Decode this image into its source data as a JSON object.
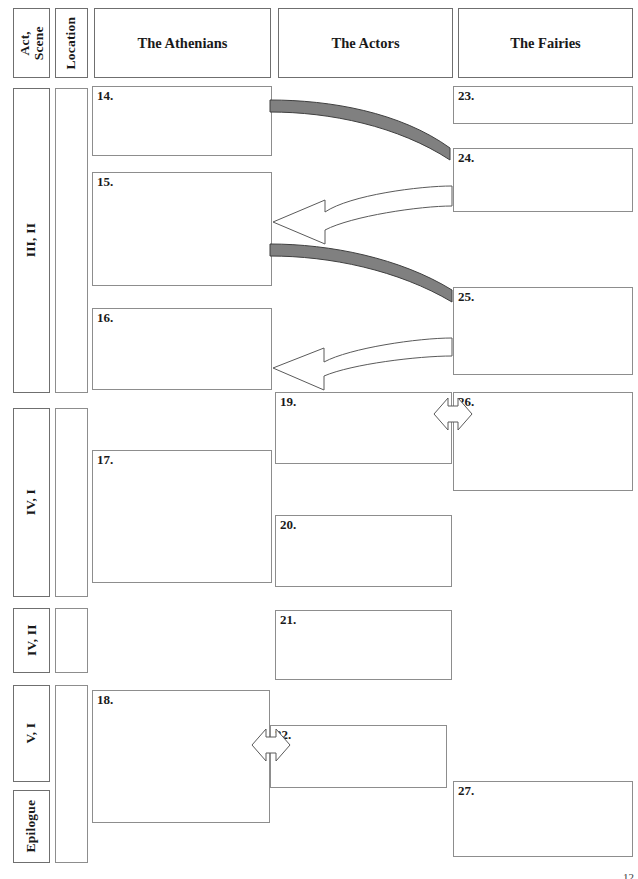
{
  "document": {
    "kind": "worksheet-grid",
    "description": "Blank character-plot tracking chart for A Midsummer Night's Dream, acts III-V plus Epilogue"
  },
  "header": {
    "act_scene_label": "Act,\nScene",
    "location_label": "Location",
    "columns": [
      {
        "id": "athenians",
        "label": "The Athenians"
      },
      {
        "id": "actors",
        "label": "The Actors"
      },
      {
        "id": "fairies",
        "label": "The Fairies"
      }
    ]
  },
  "rows": [
    {
      "id": "row-3-2",
      "act_scene": "III, II"
    },
    {
      "id": "row-4-1",
      "act_scene": "IV, I"
    },
    {
      "id": "row-4-2",
      "act_scene": "IV, II"
    },
    {
      "id": "row-5-1",
      "act_scene": "V, I"
    },
    {
      "id": "row-epilogue",
      "act_scene": "Epilogue"
    }
  ],
  "cells": [
    {
      "id": "cell-14",
      "number": "14.",
      "column": "athenians",
      "row": "row-3-2"
    },
    {
      "id": "cell-15",
      "number": "15.",
      "column": "athenians",
      "row": "row-3-2"
    },
    {
      "id": "cell-16",
      "number": "16.",
      "column": "athenians",
      "row": "row-3-2"
    },
    {
      "id": "cell-17",
      "number": "17.",
      "column": "athenians",
      "row": "row-4-1"
    },
    {
      "id": "cell-18",
      "number": "18.",
      "column": "athenians",
      "row": "row-5-1"
    },
    {
      "id": "cell-19",
      "number": "19.",
      "column": "actors",
      "row": "row-4-1"
    },
    {
      "id": "cell-20",
      "number": "20.",
      "column": "actors",
      "row": "row-4-1"
    },
    {
      "id": "cell-21",
      "number": "21.",
      "column": "actors",
      "row": "row-4-2"
    },
    {
      "id": "cell-22",
      "number": "22.",
      "column": "actors",
      "row": "row-5-1"
    },
    {
      "id": "cell-23",
      "number": "23.",
      "column": "fairies",
      "row": "row-3-2"
    },
    {
      "id": "cell-24",
      "number": "24.",
      "column": "fairies",
      "row": "row-3-2"
    },
    {
      "id": "cell-25",
      "number": "25.",
      "column": "fairies",
      "row": "row-3-2"
    },
    {
      "id": "cell-26",
      "number": "26.",
      "column": "fairies",
      "row": "row-4-1"
    },
    {
      "id": "cell-27",
      "number": "27.",
      "column": "fairies",
      "row": "row-epilogue"
    }
  ],
  "connectors": [
    {
      "id": "arrow-14-to-24",
      "style": "curved-solid-gray",
      "direction": "right",
      "from": "cell-14",
      "to": "cell-24"
    },
    {
      "id": "arrow-24-to-15",
      "style": "curved-outline-block",
      "direction": "left",
      "from": "cell-24",
      "to": "cell-15"
    },
    {
      "id": "arrow-15-to-25",
      "style": "curved-solid-gray",
      "direction": "right",
      "from": "cell-15",
      "to": "cell-25"
    },
    {
      "id": "arrow-25-to-16",
      "style": "curved-outline-block",
      "direction": "left",
      "from": "cell-25",
      "to": "cell-16"
    },
    {
      "id": "arrow-19-26",
      "style": "double-headed-outline",
      "direction": "both",
      "from": "cell-19",
      "to": "cell-26"
    },
    {
      "id": "arrow-18-22",
      "style": "double-headed-outline",
      "direction": "both",
      "from": "cell-18",
      "to": "cell-22"
    }
  ],
  "colors": {
    "box_border": "#8d8d8d",
    "header_border": "#6f6f6f",
    "arrow_gray_fill": "#808080",
    "arrow_gray_stroke": "#4a4a4a",
    "arrow_outline_stroke": "#5a5a5a",
    "page_background": "#ffffff",
    "text": "#1a1a1a"
  },
  "footer": {
    "page_number": "12"
  }
}
